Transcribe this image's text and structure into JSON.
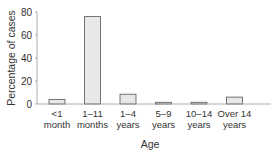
{
  "chart_data": {
    "type": "bar",
    "title": "",
    "xlabel": "Age",
    "ylabel": "Percentage of cases",
    "ylim": [
      0,
      80
    ],
    "yticks": [
      0,
      20,
      40,
      60,
      80
    ],
    "grid": false,
    "legend": null,
    "categories": [
      [
        "<1",
        "month"
      ],
      [
        "1–11",
        "months"
      ],
      [
        "1–4",
        "years"
      ],
      [
        "5–9",
        "years"
      ],
      [
        "10–14",
        "years"
      ],
      [
        "Over 14",
        "years"
      ]
    ],
    "values": [
      4,
      76,
      8.5,
      1.5,
      1.5,
      6
    ],
    "bar_fill": "#e8e8e8",
    "bar_stroke": "#555555",
    "axis_color": "#999999"
  }
}
